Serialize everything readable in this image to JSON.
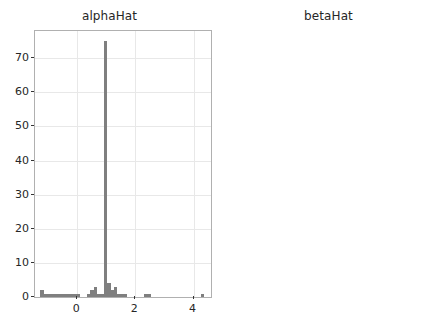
{
  "figure": {
    "background_color": "#ffffff",
    "bar_color": "#7f7f7f",
    "grid_color": "#e8e8e8",
    "axis_color": "#b0b0b0",
    "text_color": "#262626"
  },
  "chart_data": [
    {
      "type": "bar",
      "panel": "left",
      "title": "alphaHat",
      "xlabel": "",
      "ylabel": "",
      "grid": true,
      "legend": null,
      "xlim": [
        -1.45,
        4.6
      ],
      "ylim": [
        0,
        78
      ],
      "xticks": [
        0,
        2,
        4
      ],
      "xtick_labels": [
        "0",
        "2",
        "4"
      ],
      "yticks": [
        0,
        10,
        20,
        30,
        40,
        50,
        60,
        70
      ],
      "ytick_labels": [
        "0",
        "10",
        "20",
        "30",
        "40",
        "50",
        "60",
        "70"
      ],
      "bin_width": 0.115,
      "bins": [
        {
          "x": -1.21,
          "value": 2
        },
        {
          "x": -1.095,
          "value": 1
        },
        {
          "x": -0.98,
          "value": 1
        },
        {
          "x": -0.865,
          "value": 1
        },
        {
          "x": -0.75,
          "value": 1
        },
        {
          "x": -0.635,
          "value": 1
        },
        {
          "x": -0.52,
          "value": 1
        },
        {
          "x": -0.405,
          "value": 1
        },
        {
          "x": -0.29,
          "value": 1
        },
        {
          "x": -0.175,
          "value": 1
        },
        {
          "x": -0.06,
          "value": 1
        },
        {
          "x": 0.055,
          "value": 1
        },
        {
          "x": 0.4,
          "value": 1
        },
        {
          "x": 0.515,
          "value": 2
        },
        {
          "x": 0.63,
          "value": 3
        },
        {
          "x": 0.745,
          "value": 1
        },
        {
          "x": 0.86,
          "value": 1
        },
        {
          "x": 0.975,
          "value": 75
        },
        {
          "x": 1.09,
          "value": 4
        },
        {
          "x": 1.205,
          "value": 2
        },
        {
          "x": 1.32,
          "value": 3
        },
        {
          "x": 1.435,
          "value": 1
        },
        {
          "x": 1.55,
          "value": 1
        },
        {
          "x": 1.665,
          "value": 1
        },
        {
          "x": 2.355,
          "value": 1
        },
        {
          "x": 2.47,
          "value": 1
        },
        {
          "x": 4.31,
          "value": 1
        }
      ]
    },
    {
      "type": "bar",
      "panel": "right",
      "title": "betaHat",
      "xlabel": "",
      "ylabel": "",
      "grid": true,
      "legend": null,
      "xlim": [
        -5.6,
        4.4
      ],
      "ylim": [
        0,
        78
      ],
      "xticks": [
        -5.0,
        -2.5,
        0.0,
        2.5
      ],
      "xtick_labels": [
        "−5.0",
        "−2.5",
        "0.0",
        "2.5"
      ],
      "yticks": [
        0,
        10,
        20,
        30,
        40,
        50,
        60,
        70
      ],
      "ytick_labels": [
        "0",
        "10",
        "20",
        "30",
        "40",
        "50",
        "60",
        "70"
      ],
      "bin_width": 0.19,
      "bins": [
        {
          "x": -5.15,
          "value": 1
        },
        {
          "x": -2.1,
          "value": 1
        },
        {
          "x": -1.91,
          "value": 1
        },
        {
          "x": -1.15,
          "value": 1
        },
        {
          "x": -0.77,
          "value": 1
        },
        {
          "x": -0.2,
          "value": 1
        },
        {
          "x": 0.37,
          "value": 3
        },
        {
          "x": 1.13,
          "value": 1
        },
        {
          "x": 1.32,
          "value": 1
        },
        {
          "x": 1.51,
          "value": 1
        },
        {
          "x": 2.08,
          "value": 1
        },
        {
          "x": 2.27,
          "value": 2
        },
        {
          "x": 2.46,
          "value": 1
        },
        {
          "x": 2.65,
          "value": 3
        },
        {
          "x": 2.84,
          "value": 74
        },
        {
          "x": 3.03,
          "value": 3
        },
        {
          "x": 3.22,
          "value": 3
        },
        {
          "x": 3.98,
          "value": 1
        }
      ]
    }
  ]
}
